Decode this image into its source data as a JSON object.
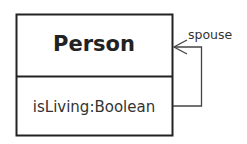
{
  "diagram": {
    "type": "uml-class",
    "class": {
      "name": "Person",
      "attributes": [
        "isLiving:Boolean"
      ]
    },
    "associations": [
      {
        "kind": "self-association",
        "role": "spouse",
        "navigable": true
      }
    ],
    "colors": {
      "stroke": "#222222",
      "text": "#333333",
      "background": "#ffffff"
    }
  }
}
